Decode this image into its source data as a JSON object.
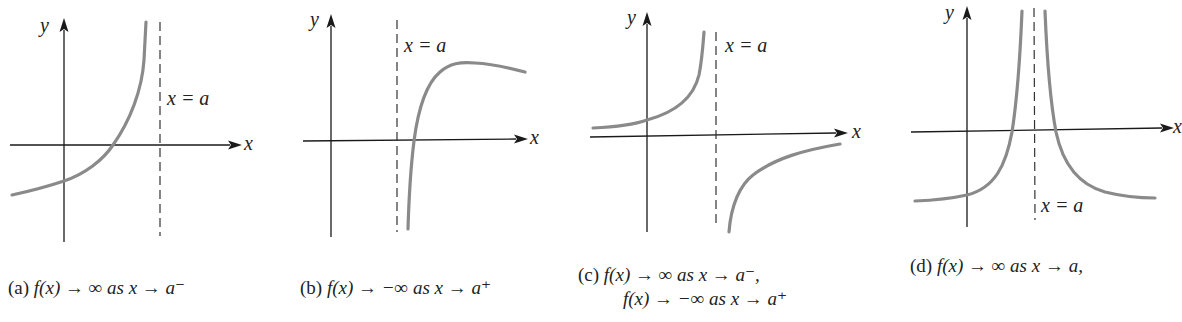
{
  "figure": {
    "panels": [
      {
        "id": "a",
        "y_label": "y",
        "x_label": "x",
        "asymptote_label": "x = a",
        "caption_prefix": "(a)",
        "caption_line1": "f(x) → ∞ as x → a⁻",
        "caption_line2": ""
      },
      {
        "id": "b",
        "y_label": "y",
        "x_label": "x",
        "asymptote_label": "x = a",
        "caption_prefix": "(b)",
        "caption_line1": "f(x) → −∞ as x → a⁺",
        "caption_line2": ""
      },
      {
        "id": "c",
        "y_label": "y",
        "x_label": "x",
        "asymptote_label": "x = a",
        "caption_prefix": "(c)",
        "caption_line1": "f(x) → ∞ as x → a⁻,",
        "caption_line2": "f(x) → −∞ as x → a⁺"
      },
      {
        "id": "d",
        "y_label": "y",
        "x_label": "x",
        "asymptote_label": "x = a",
        "caption_prefix": "(d)",
        "caption_line1": "f(x) → ∞ as x → a,",
        "caption_line2": ""
      }
    ],
    "colors": {
      "axis": "#1a1a1a",
      "curve": "#8a8a8a",
      "asymptote": "#333333",
      "background": "#ffffff"
    }
  }
}
